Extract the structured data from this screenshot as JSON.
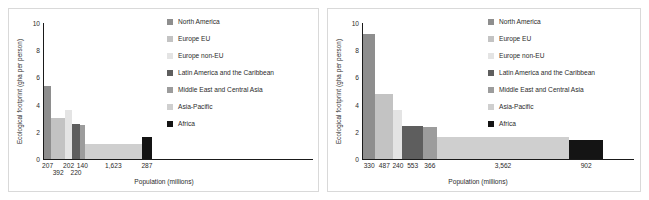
{
  "figure": {
    "background": "#ffffff",
    "panel_border": "#d9d9d9"
  },
  "palette": {
    "north_america": "#8e8e8e",
    "europe_eu": "#c3c3c3",
    "europe_non_eu": "#e4e4e4",
    "latin_america": "#5e5e5e",
    "middle_east": "#9c9c9c",
    "asia_pacific": "#cfcfcf",
    "africa": "#141414",
    "axis": "#1a1a1a",
    "text": "#2b2b2b"
  },
  "legend": {
    "items": [
      {
        "label": "North America",
        "color_key": "north_america"
      },
      {
        "label": "Europe EU",
        "color_key": "europe_eu"
      },
      {
        "label": "Europe non-EU",
        "color_key": "europe_non_eu"
      },
      {
        "label": "Latin America and the Caribbean",
        "color_key": "latin_america"
      },
      {
        "label": "Middle East and Central Asia",
        "color_key": "middle_east"
      },
      {
        "label": "Asia-Pacific",
        "color_key": "asia_pacific"
      },
      {
        "label": "Africa",
        "color_key": "africa"
      }
    ]
  },
  "chart_data": [
    {
      "id": "left",
      "type": "bar",
      "title": "",
      "xlabel": "Population (millions)",
      "ylabel": "Ecological footprint (gha per person)",
      "ylim": [
        0,
        10
      ],
      "yticks": [
        0,
        2,
        4,
        6,
        8,
        10
      ],
      "grid": false,
      "legend_position": "right",
      "note": "Marimekko / variable-width bar chart: bar width is proportional to population, bar height is ecological footprint.",
      "categories": [
        "North America",
        "Europe EU",
        "Europe non-EU",
        "Latin America and the Caribbean",
        "Middle East and Central Asia",
        "Asia-Pacific",
        "Africa"
      ],
      "x_tick_labels": [
        "207",
        "392",
        "202",
        "220",
        "140",
        "1,623",
        "287"
      ],
      "widths_population_millions": [
        207,
        392,
        202,
        220,
        140,
        1623,
        287
      ],
      "values": [
        5.35,
        3.05,
        3.6,
        2.6,
        2.5,
        1.1,
        1.65
      ]
    },
    {
      "id": "right",
      "type": "bar",
      "title": "",
      "xlabel": "Population (millions)",
      "ylabel": "Ecological footprint (gha per person)",
      "ylim": [
        0,
        10
      ],
      "yticks": [
        0,
        2,
        4,
        6,
        8,
        10
      ],
      "grid": false,
      "legend_position": "right",
      "note": "Marimekko / variable-width bar chart: bar width is proportional to population, bar height is ecological footprint.",
      "categories": [
        "North America",
        "Europe EU",
        "Europe non-EU",
        "Latin America and the Caribbean",
        "Middle East and Central Asia",
        "Asia-Pacific",
        "Africa"
      ],
      "x_tick_labels": [
        "330",
        "487",
        "240",
        "553",
        "366",
        "3,562",
        "902"
      ],
      "widths_population_millions": [
        330,
        487,
        240,
        553,
        366,
        3562,
        902
      ],
      "values": [
        9.2,
        4.75,
        3.6,
        2.45,
        2.35,
        1.6,
        1.4
      ]
    }
  ]
}
